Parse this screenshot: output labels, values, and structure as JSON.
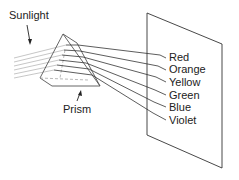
{
  "diagram": {
    "labels": {
      "sunlight": "Sunlight",
      "prism": "Prism"
    },
    "spectrum": [
      {
        "name": "Red"
      },
      {
        "name": "Orange"
      },
      {
        "name": "Yellow"
      },
      {
        "name": "Green"
      },
      {
        "name": "Blue"
      },
      {
        "name": "Violet"
      }
    ]
  }
}
